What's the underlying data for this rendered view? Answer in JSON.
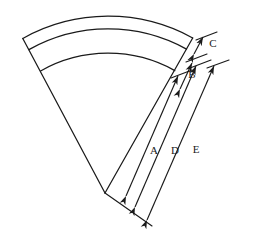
{
  "figure": {
    "background_color": "#ffffff",
    "stroke_color": "#1a1a1a",
    "label_color": "#1a1a1a",
    "width": 253,
    "height": 245
  },
  "shape": {
    "type": "annular-sector",
    "description": "Curved fan-shaped band formed by three concentric arcs closed by two straight radial edges",
    "arc_count": 3,
    "center": {
      "x": 105,
      "y": 193
    },
    "radii": [
      175,
      162,
      137
    ],
    "angle_start_deg": -118,
    "angle_end_deg": -52
  },
  "dimensions": [
    {
      "id": "A",
      "label": "A",
      "label_x": 154,
      "label_y": 154,
      "arrow": "double",
      "from": {
        "x": 126,
        "y": 196
      },
      "to": {
        "x": 178,
        "y": 76
      }
    },
    {
      "id": "B",
      "label": "B",
      "label_x": 192,
      "label_y": 78,
      "arrow": "double",
      "from": {
        "x": 180,
        "y": 89
      },
      "to": {
        "x": 192,
        "y": 63
      }
    },
    {
      "id": "C",
      "label": "C",
      "label_x": 213,
      "label_y": 47,
      "arrow": "double",
      "from": {
        "x": 194,
        "y": 54
      },
      "to": {
        "x": 203,
        "y": 37
      }
    },
    {
      "id": "D",
      "label": "D",
      "label_x": 175,
      "label_y": 154,
      "arrow": "double",
      "from": {
        "x": 135,
        "y": 207
      },
      "to": {
        "x": 196,
        "y": 66
      }
    },
    {
      "id": "E",
      "label": "E",
      "label_x": 196,
      "label_y": 153,
      "arrow": "double",
      "from": {
        "x": 147,
        "y": 220
      },
      "to": {
        "x": 214,
        "y": 66
      }
    }
  ],
  "extension_lines": [
    {
      "id": "ext-top-a",
      "x1": 171,
      "y1": 78,
      "x2": 192,
      "y2": 70
    },
    {
      "id": "ext-top-b",
      "x1": 186,
      "y1": 62,
      "x2": 207,
      "y2": 54
    },
    {
      "id": "ext-top-c",
      "x1": 196,
      "y1": 40,
      "x2": 217,
      "y2": 32
    },
    {
      "id": "ext-top-d",
      "x1": 190,
      "y1": 68,
      "x2": 211,
      "y2": 60
    },
    {
      "id": "ext-top-e",
      "x1": 207,
      "y1": 68,
      "x2": 229,
      "y2": 60
    },
    {
      "id": "ext-bottom",
      "x1": 105,
      "y1": 193,
      "x2": 152,
      "y2": 226
    }
  ]
}
